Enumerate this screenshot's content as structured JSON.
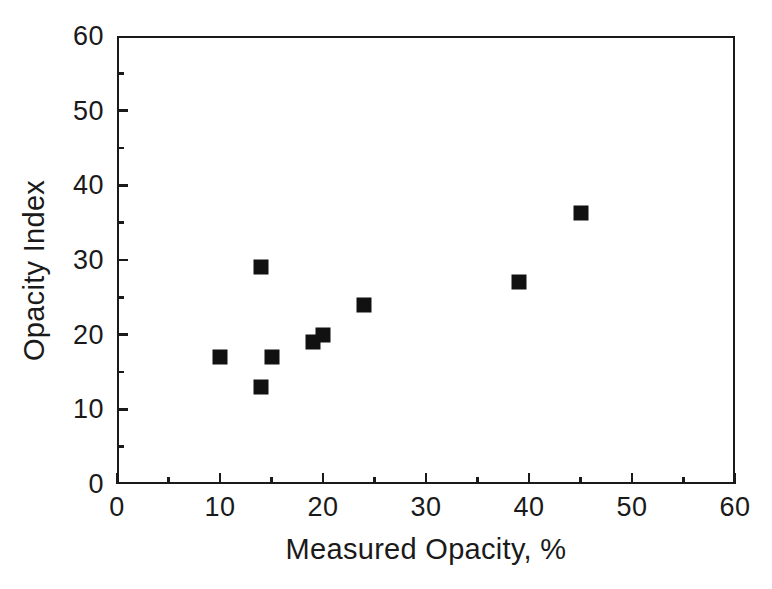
{
  "chart_data": {
    "type": "scatter",
    "title": "",
    "xlabel": "Measured Opacity, %",
    "ylabel": "Opacity Index",
    "xlim": [
      0,
      60
    ],
    "ylim": [
      0,
      60
    ],
    "xticks": [
      0,
      10,
      20,
      30,
      40,
      50,
      60
    ],
    "xticklabels": [
      "0",
      "10",
      "20",
      "30",
      "40",
      "50",
      "60"
    ],
    "yticks": [
      0,
      10,
      20,
      30,
      40,
      50,
      60
    ],
    "yticklabels": [
      "0",
      "10",
      "20",
      "30",
      "40",
      "50",
      "60"
    ],
    "x_minor_ticks": [
      5,
      15,
      25,
      35,
      45,
      55
    ],
    "y_minor_ticks": [
      5,
      15,
      25,
      35,
      45,
      55
    ],
    "grid": false,
    "legend": null,
    "marker_style": "filled-square",
    "marker_color": "#111111",
    "frame_color": "#1a1a1a",
    "background_color": "#ffffff",
    "series": [
      {
        "name": "Opacity Index vs Measured Opacity",
        "points": [
          {
            "x": 10,
            "y": 17
          },
          {
            "x": 14,
            "y": 29
          },
          {
            "x": 14,
            "y": 13
          },
          {
            "x": 15,
            "y": 17
          },
          {
            "x": 19,
            "y": 19
          },
          {
            "x": 20,
            "y": 20
          },
          {
            "x": 24,
            "y": 24
          },
          {
            "x": 39,
            "y": 27
          },
          {
            "x": 45,
            "y": 36.3
          }
        ]
      }
    ]
  },
  "artifact": {
    "bottom_text": ""
  }
}
